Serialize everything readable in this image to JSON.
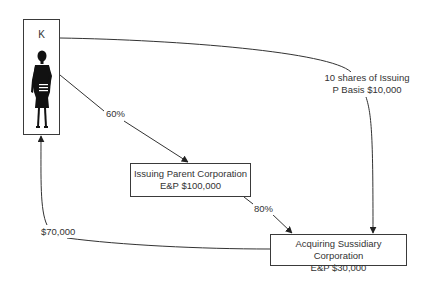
{
  "diagram": {
    "nodes": {
      "shareholder": {
        "label": "K",
        "icon": "businesswoman-silhouette-icon"
      },
      "issuing_parent": {
        "line1": "Issuing Parent Corporation",
        "line2": "E&P $100,000"
      },
      "acquiring_subsidiary": {
        "line1": "Acquiring Sussidiary Corporation",
        "line2": "E&P $30,000"
      }
    },
    "edges": {
      "k_to_parent": {
        "label": "60%"
      },
      "parent_to_subsidiary": {
        "label": "80%"
      },
      "k_to_subsidiary": {
        "line1": "10 shares of Issuing",
        "line2": "P Basis $10,000"
      },
      "subsidiary_to_k": {
        "label": "$70,000"
      }
    },
    "colors": {
      "stroke": "#333333",
      "text": "#333333",
      "background": "#ffffff"
    }
  }
}
